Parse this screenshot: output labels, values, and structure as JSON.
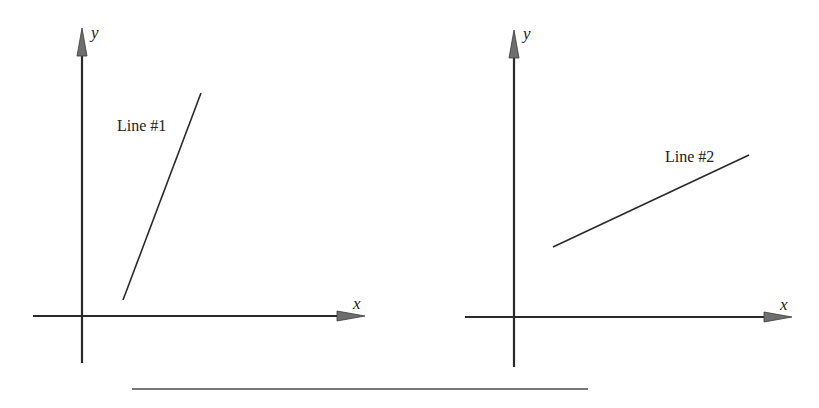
{
  "diagram": {
    "colors": {
      "stroke": "#2a2a2a",
      "arrow": "#6e6e6e",
      "background": "#ffffff"
    },
    "panels": [
      {
        "id": "left",
        "x_axis_label": "x",
        "y_axis_label": "y",
        "line_label": "Line #1",
        "line": {
          "from": [
            123,
            300
          ],
          "to": [
            201,
            93
          ],
          "description": "steep positive slope"
        }
      },
      {
        "id": "right",
        "x_axis_label": "x",
        "y_axis_label": "y",
        "line_label": "Line #2",
        "line": {
          "from": [
            553,
            247
          ],
          "to": [
            749,
            155
          ],
          "description": "shallow positive slope"
        }
      }
    ],
    "separator": {
      "from": [
        132,
        389
      ],
      "to": [
        588,
        389
      ]
    }
  }
}
